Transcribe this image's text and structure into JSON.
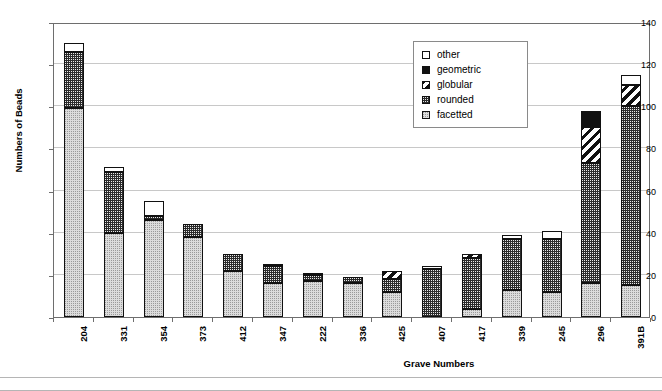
{
  "chart_data": {
    "type": "bar",
    "subtype": "stacked-bar",
    "title": "",
    "xlabel": "Grave Numbers",
    "ylabel": "Numbers of Beads",
    "ylim": [
      0,
      140
    ],
    "ytick_step": 20,
    "yticks": [
      0,
      20,
      40,
      60,
      80,
      100,
      120,
      140
    ],
    "grid": true,
    "legend_position": "top-right",
    "categories": [
      "204",
      "331",
      "354",
      "373",
      "412",
      "347",
      "222",
      "336",
      "425",
      "407",
      "417",
      "339",
      "245",
      "296",
      "391B"
    ],
    "series": [
      {
        "name": "facetted",
        "values": [
          99,
          40,
          46,
          38,
          22,
          16,
          17,
          16,
          12,
          0,
          4,
          13,
          12,
          16,
          15
        ]
      },
      {
        "name": "rounded",
        "values": [
          27,
          29,
          2,
          6,
          8,
          8,
          3,
          3,
          6,
          23,
          24,
          24,
          25,
          57,
          85
        ]
      },
      {
        "name": "globular",
        "values": [
          0,
          0,
          0,
          0,
          0,
          0,
          0,
          0,
          4,
          0,
          2,
          0,
          0,
          17,
          10
        ]
      },
      {
        "name": "geometric",
        "values": [
          0,
          0,
          0,
          0,
          0,
          0,
          0,
          0,
          0,
          0,
          0,
          0,
          0,
          8,
          0
        ]
      },
      {
        "name": "other",
        "values": [
          4,
          2,
          7,
          0,
          0,
          1,
          1,
          0,
          0,
          1,
          0,
          2,
          4,
          0,
          5
        ]
      }
    ],
    "totals": [
      130,
      71,
      55,
      44,
      30,
      25,
      21,
      19,
      22,
      24,
      30,
      39,
      41,
      98,
      115
    ]
  },
  "legend": {
    "items": [
      {
        "label": "other",
        "pattern": "f-other"
      },
      {
        "label": "geometric",
        "pattern": "f-geometric"
      },
      {
        "label": "globular",
        "pattern": "f-globular"
      },
      {
        "label": "rounded",
        "pattern": "f-rounded"
      },
      {
        "label": "facetted",
        "pattern": "f-facetted"
      }
    ]
  },
  "axis": {
    "y_title": "Numbers of Beads",
    "x_title": "Grave Numbers"
  }
}
